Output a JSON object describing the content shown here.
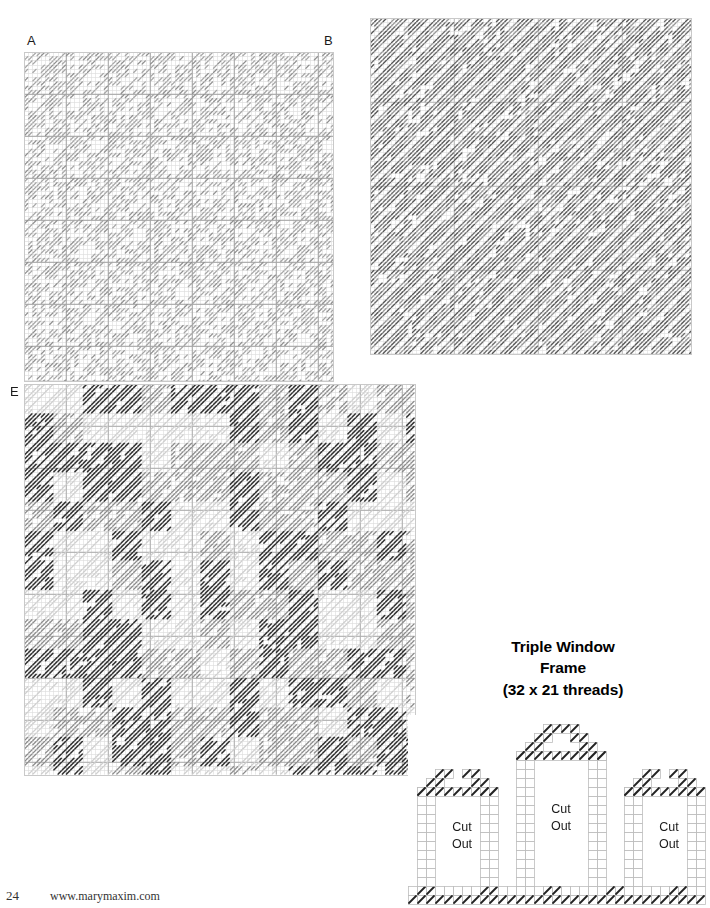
{
  "page": {
    "width": 710,
    "height": 908,
    "background": "#ffffff",
    "kind": "plastic-canvas-stitch-chart-page"
  },
  "footer": {
    "page_number": "24",
    "website": "www.marymaxim.com"
  },
  "charts": [
    {
      "id": "chart-a-b",
      "corner_labels": [
        {
          "text": "A",
          "position": "top-left"
        },
        {
          "text": "B",
          "position": "top-right"
        }
      ],
      "x": 24,
      "y": 52,
      "width": 310,
      "height": 330,
      "cell": 4.2,
      "cols": 74,
      "rows": 79,
      "bold_every": 10,
      "stitch_style": "diagonal-slant",
      "stitch_color": "#a6a6a6",
      "grid_color": "#dcdcdc",
      "bold_grid_color": "#a8a8a8",
      "density": "light",
      "description": "Large light-gray diagonal stitch field with bold grid every 10 threads"
    },
    {
      "id": "chart-top-right",
      "corner_labels": [],
      "x": 370,
      "y": 18,
      "width": 322,
      "height": 337,
      "cell": 4.2,
      "cols": 77,
      "rows": 80,
      "bold_every": 20,
      "stitch_style": "diagonal-slant",
      "stitch_color": "#6e6e6e",
      "grid_color": "#e0e0e0",
      "bold_grid_color": "#bdbdbd",
      "density": "dense",
      "description": "Dense medium-gray diagonal stitch field, uniform coverage"
    },
    {
      "id": "chart-e",
      "corner_labels": [
        {
          "text": "E",
          "position": "top-left"
        }
      ],
      "x": 24,
      "y": 384,
      "width": 392,
      "height": 392,
      "cell": 4.2,
      "cols": 93,
      "rows": 93,
      "bold_every": 10,
      "stitch_style": "diagonal-slant",
      "stitch_color_dark": "#2f2f2f",
      "stitch_color_mid": "#8c8c8c",
      "stitch_color_light": "#cfcfcf",
      "grid_color": "#dcdcdc",
      "bold_grid_color": "#b0b0b0",
      "density": "mixed-blocks",
      "description": "Plaid-like arrangement of dark, mid and light diagonal stitch blocks"
    }
  ],
  "triple_window_frame": {
    "title_lines": [
      "Triple Window",
      "Frame",
      "(32 x 21 threads)"
    ],
    "threads_width": 32,
    "threads_height": 21,
    "x": 408,
    "y": 715,
    "width": 300,
    "height": 193,
    "cell": 9.0,
    "outline_color": "#bdbdbd",
    "stitch_color": "#222222",
    "windows": [
      {
        "name": "left-window",
        "label": "Cut\nOut",
        "label_line1": "Cut",
        "label_line2": "Out"
      },
      {
        "name": "center-window",
        "label": "Cut\nOut",
        "label_line1": "Cut",
        "label_line2": "Out"
      },
      {
        "name": "right-window",
        "label": "Cut\nOut",
        "label_line1": "Cut",
        "label_line2": "Out"
      }
    ],
    "cut_out_label_line1": "Cut",
    "cut_out_label_line2": "Out"
  },
  "chart_data": {
    "type": "heatmap",
    "xlabel": "",
    "ylabel": "",
    "legend": [],
    "series": [
      {
        "name": "chart-a-b",
        "coverage_pct": 55,
        "shade": "light",
        "cols": 74,
        "rows": 79
      },
      {
        "name": "chart-top-right",
        "coverage_pct": 92,
        "shade": "medium",
        "cols": 77,
        "rows": 80
      },
      {
        "name": "chart-e",
        "coverage_pct": 78,
        "shade": "mixed",
        "cols": 93,
        "rows": 93
      }
    ]
  }
}
